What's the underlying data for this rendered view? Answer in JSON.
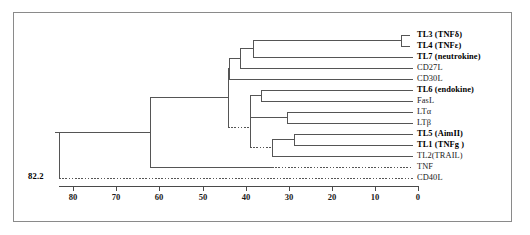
{
  "figure": {
    "type": "dendrogram",
    "root_distance_label": "82.2"
  },
  "leaves": [
    {
      "id": "TL3",
      "label": "TL3 (TNFδ)",
      "bold": true,
      "y": 35,
      "branch_x": 410,
      "dotted": false
    },
    {
      "id": "TL4",
      "label": "TL4 (TNFε)",
      "bold": true,
      "y": 46,
      "branch_x": 410,
      "dotted": false
    },
    {
      "id": "CD27L_TL7",
      "label": "TL7 (neutrokine)",
      "bold": true,
      "y": 57,
      "branch_x": 413,
      "dotted": false
    },
    {
      "id": "CD27L",
      "label": "CD27L",
      "bold": false,
      "y": 68,
      "branch_x": 413,
      "dotted": false
    },
    {
      "id": "CD30L",
      "label": "CD30L",
      "bold": false,
      "y": 79,
      "branch_x": 413,
      "dotted": false
    },
    {
      "id": "TL6",
      "label": "TL6 (endokine)",
      "bold": true,
      "y": 90,
      "branch_x": 413,
      "dotted": false
    },
    {
      "id": "FasL",
      "label": "FasL",
      "bold": false,
      "y": 101,
      "branch_x": 413,
      "dotted": false
    },
    {
      "id": "LTa",
      "label": "LTα",
      "bold": false,
      "y": 112,
      "branch_x": 413,
      "dotted": false
    },
    {
      "id": "LTb",
      "label": "LTβ",
      "bold": false,
      "y": 123,
      "branch_x": 413,
      "dotted": false
    },
    {
      "id": "TL5",
      "label": "TL5 (AimII)",
      "bold": true,
      "y": 134,
      "branch_x": 413,
      "dotted": false
    },
    {
      "id": "TL1",
      "label": "TL1 (TNFg )",
      "bold": true,
      "y": 145,
      "branch_x": 413,
      "dotted": false
    },
    {
      "id": "TL2",
      "label": "TL2(TRAIL)",
      "bold": false,
      "y": 156,
      "branch_x": 413,
      "dotted": false
    },
    {
      "id": "TNF",
      "label": "TNF",
      "bold": false,
      "y": 167,
      "branch_x": 413,
      "dotted": true
    },
    {
      "id": "CD40L",
      "label": "CD40L",
      "bold": false,
      "y": 178,
      "branch_x": 413,
      "dotted": true
    }
  ],
  "axis": {
    "ticks": [
      {
        "value": "80",
        "x": 73
      },
      {
        "value": "70",
        "x": 116
      },
      {
        "value": "60",
        "x": 159
      },
      {
        "value": "50",
        "x": 203
      },
      {
        "value": "40",
        "x": 246
      },
      {
        "value": "30",
        "x": 289
      },
      {
        "value": "20",
        "x": 332
      },
      {
        "value": "10",
        "x": 375
      },
      {
        "value": "0",
        "x": 418
      }
    ],
    "line_y": 186,
    "label_y": 192,
    "x_left": 59,
    "x_right": 418
  },
  "colors": {
    "line": "#555555",
    "frame": "#8a8a8a",
    "background": "#ffffff",
    "text": "#1a1a1a"
  }
}
